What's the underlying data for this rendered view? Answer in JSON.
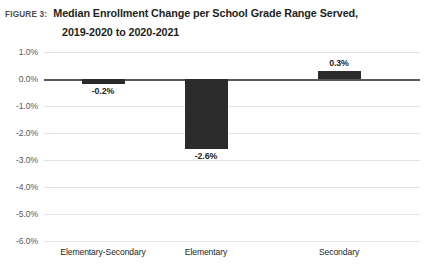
{
  "header": {
    "figure_label": "FIGURE 3:",
    "title_line_1": "Median Enrollment Change per School Grade Range Served,",
    "title_line_2": "2019-2020 to 2020-2021"
  },
  "colors": {
    "bar": "#2b2b2b",
    "gridline": "#e3e3e3",
    "zero_line": "#58595b",
    "text": "#231f20",
    "muted_text": "#58595b"
  },
  "chart_data": {
    "type": "bar",
    "title": "Median Enrollment Change per School Grade Range Served, 2019-2020 to 2020-2021",
    "xlabel": "",
    "ylabel": "",
    "ylim": [
      -6.0,
      1.0
    ],
    "ytick_step": 1.0,
    "grid": true,
    "legend": "none",
    "orientation": "vertical",
    "yticks": [
      "1.0%",
      "0.0%",
      "-1.0%",
      "-2.0%",
      "-3.0%",
      "-4.0%",
      "-5.0%",
      "-6.0%"
    ],
    "ytick_values": [
      1.0,
      0.0,
      -1.0,
      -2.0,
      -3.0,
      -4.0,
      -5.0,
      -6.0
    ],
    "categories": [
      "Elementary-Secondary",
      "Elementary",
      "Secondary"
    ],
    "values": [
      -0.2,
      -2.6,
      0.3
    ],
    "data_labels": [
      "-0.2%",
      "-2.6%",
      "0.3%"
    ]
  }
}
